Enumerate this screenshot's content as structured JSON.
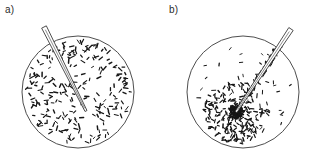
{
  "figure": {
    "background_color": "#ffffff",
    "ink_color": "#161616",
    "outline_color": "#3a3a3a",
    "width": 311,
    "height": 158
  },
  "panels": [
    {
      "id": "panel-a",
      "label": "a)",
      "dish": {
        "cx": 78,
        "cy": 92,
        "r": 56
      },
      "capillary": {
        "tail_x": 44,
        "tail_y": 27,
        "tip_x": 86,
        "tip_y": 111,
        "half_width": 2.6,
        "has_adhered_bacteria": false
      },
      "bacteria_distribution": "uniform",
      "bacteria_count": 240,
      "cluster": null
    },
    {
      "id": "panel-b",
      "label": "b)",
      "dish": {
        "cx": 243,
        "cy": 92,
        "r": 56
      },
      "capillary": {
        "tail_x": 291,
        "tail_y": 29,
        "tip_x": 236,
        "tip_y": 112,
        "half_width": 2.6,
        "has_adhered_bacteria": true
      },
      "bacteria_distribution": "clustered-at-capillary-tip",
      "bacteria_count": 340,
      "cluster": {
        "cx": 236,
        "cy": 112,
        "core_r": 7,
        "halo_r": 32
      }
    }
  ],
  "colors": {
    "background": "#ffffff",
    "bacteria": "#161616",
    "dish_stroke": "#3a3a3a",
    "capillary_stroke": "#2e2e2e",
    "label_text": "#2b2b2b"
  }
}
